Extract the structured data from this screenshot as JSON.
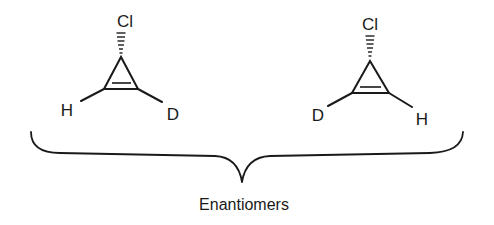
{
  "diagram": {
    "molecules": [
      {
        "id": "left",
        "substituents": {
          "top": "Cl",
          "bottom_left": "H",
          "bottom_right": "D"
        },
        "top_bond": "hashed-wedge",
        "ring": "cyclopropene"
      },
      {
        "id": "right",
        "substituents": {
          "top": "Cl",
          "bottom_left": "D",
          "bottom_right": "H"
        },
        "top_bond": "hashed-wedge",
        "ring": "cyclopropene"
      }
    ],
    "brace_label": "Enantiomers"
  }
}
